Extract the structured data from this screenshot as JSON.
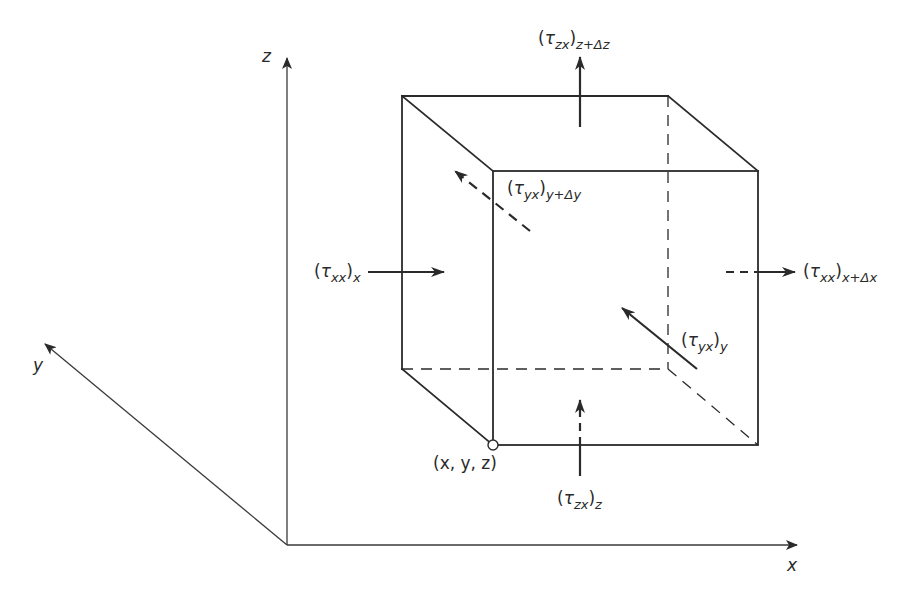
{
  "diagram": {
    "axes": {
      "x": {
        "label": "x"
      },
      "y": {
        "label": "y"
      },
      "z": {
        "label": "z"
      }
    },
    "corner_label": "(x, y, z)",
    "stress_labels": {
      "tau_xx_x": {
        "symbol": "τ",
        "sub_inner": "xx",
        "sub_outer": "x"
      },
      "tau_xx_xdx": {
        "symbol": "τ",
        "sub_inner": "xx",
        "sub_outer": "x+Δx"
      },
      "tau_yx_y": {
        "symbol": "τ",
        "sub_inner": "yx",
        "sub_outer": "y"
      },
      "tau_yx_ydy": {
        "symbol": "τ",
        "sub_inner": "yx",
        "sub_outer": "y+Δy"
      },
      "tau_zx_z": {
        "symbol": "τ",
        "sub_inner": "zx",
        "sub_outer": "z"
      },
      "tau_zx_zdz": {
        "symbol": "τ",
        "sub_inner": "zx",
        "sub_outer": "z+Δz"
      }
    },
    "colors": {
      "line": "#2a2a2a",
      "background": "#ffffff"
    }
  }
}
